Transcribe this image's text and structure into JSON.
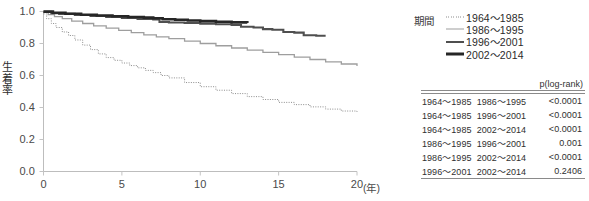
{
  "chart_data": {
    "type": "line",
    "title": "",
    "xlabel": "(年)",
    "ylabel": "生着率",
    "xlim": [
      0,
      20
    ],
    "ylim": [
      0.0,
      1.0
    ],
    "xticks": [
      "0",
      "5",
      "10",
      "15",
      "20"
    ],
    "yticks": [
      "0.0",
      "0.2",
      "0.4",
      "0.6",
      "0.8",
      "1.0"
    ],
    "grid": false,
    "legend_position": "right-top",
    "legend_title": "期間",
    "series": [
      {
        "name": "1964～1985",
        "style": "dotted",
        "color": "#8d8d8d",
        "width": 1,
        "x": [
          0,
          0.2,
          0.5,
          0.8,
          1.2,
          1.6,
          2.0,
          2.5,
          3.0,
          3.5,
          4.0,
          4.5,
          5.0,
          5.5,
          6.0,
          6.5,
          7.0,
          7.5,
          8.0,
          9.0,
          10.0,
          11.0,
          12.0,
          13.0,
          14.0,
          15.0,
          16.0,
          17.0,
          18.0,
          19.0,
          20.0
        ],
        "y": [
          0.985,
          0.955,
          0.925,
          0.9,
          0.872,
          0.85,
          0.822,
          0.79,
          0.762,
          0.735,
          0.712,
          0.695,
          0.678,
          0.662,
          0.648,
          0.632,
          0.618,
          0.6,
          0.585,
          0.556,
          0.53,
          0.508,
          0.487,
          0.468,
          0.45,
          0.432,
          0.418,
          0.404,
          0.39,
          0.378,
          0.368
        ]
      },
      {
        "name": "1986～1995",
        "style": "solid",
        "color": "#9e9e9e",
        "width": 1.3,
        "x": [
          0,
          0.3,
          0.7,
          1.2,
          1.8,
          2.5,
          3.2,
          4.0,
          4.8,
          5.6,
          6.4,
          7.2,
          8.0,
          9.0,
          10.0,
          11.0,
          12.0,
          13.0,
          14.0,
          15.0,
          16.0,
          17.0,
          18.0,
          19.0,
          20.0
        ],
        "y": [
          0.995,
          0.98,
          0.968,
          0.955,
          0.94,
          0.925,
          0.91,
          0.896,
          0.882,
          0.868,
          0.854,
          0.842,
          0.83,
          0.815,
          0.8,
          0.786,
          0.772,
          0.758,
          0.744,
          0.73,
          0.715,
          0.7,
          0.685,
          0.672,
          0.66
        ]
      },
      {
        "name": "1996～2001",
        "style": "solid",
        "color": "#4f4f4f",
        "width": 2.1,
        "x": [
          0,
          0.5,
          1.0,
          2.0,
          3.0,
          4.0,
          5.0,
          6.0,
          7.0,
          7.4,
          8.0,
          9.0,
          10.0,
          11.0,
          12.0,
          12.6,
          13.4,
          14.0,
          14.6,
          15.3,
          16.0,
          16.6,
          17.4,
          18.0
        ],
        "y": [
          0.998,
          0.99,
          0.985,
          0.978,
          0.972,
          0.966,
          0.96,
          0.954,
          0.95,
          0.934,
          0.931,
          0.928,
          0.924,
          0.92,
          0.916,
          0.905,
          0.9,
          0.89,
          0.886,
          0.872,
          0.868,
          0.852,
          0.848,
          0.848
        ]
      },
      {
        "name": "2002～2014",
        "style": "solid",
        "color": "#262626",
        "width": 2.6,
        "x": [
          0,
          0.6,
          1.4,
          2.4,
          3.4,
          4.4,
          5.4,
          6.4,
          7.0,
          7.6,
          8.4,
          9.2,
          10.0,
          11.0,
          12.0,
          13.0
        ],
        "y": [
          0.999,
          0.992,
          0.986,
          0.98,
          0.975,
          0.97,
          0.966,
          0.962,
          0.958,
          0.952,
          0.948,
          0.944,
          0.94,
          0.936,
          0.932,
          0.928
        ]
      }
    ],
    "pvalue_table": {
      "caption": "p(log-rank)",
      "columns": [
        "group_a",
        "group_b",
        "p"
      ],
      "rows": [
        {
          "group_a": "1964～1985",
          "group_b": "1986～1995",
          "p": "<0.0001"
        },
        {
          "group_a": "1964～1985",
          "group_b": "1996～2001",
          "p": "<0.0001"
        },
        {
          "group_a": "1964～1985",
          "group_b": "2002～2014",
          "p": "<0.0001"
        },
        {
          "group_a": "1986～1995",
          "group_b": "1996～2001",
          "p": "0.001"
        },
        {
          "group_a": "1986～1995",
          "group_b": "2002～2014",
          "p": "<0.0001"
        },
        {
          "group_a": "1996～2001",
          "group_b": "2002～2014",
          "p": "0.2406"
        }
      ]
    }
  }
}
